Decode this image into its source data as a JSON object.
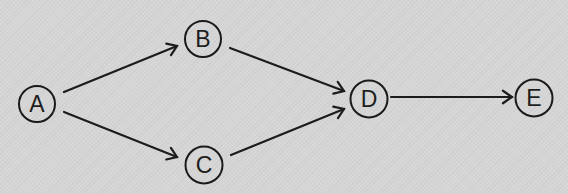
{
  "diagram": {
    "type": "directed-graph",
    "colors": {
      "background": "#d6d6d6",
      "stroke": "#1c1c1c",
      "text": "#1e1e1e"
    },
    "nodes": [
      {
        "id": "A",
        "label": "A",
        "cx": 37,
        "cy": 104,
        "r": 18
      },
      {
        "id": "B",
        "label": "B",
        "cx": 203,
        "cy": 39,
        "r": 18
      },
      {
        "id": "C",
        "label": "C",
        "cx": 204,
        "cy": 165,
        "r": 18.5
      },
      {
        "id": "D",
        "label": "D",
        "cx": 369,
        "cy": 99,
        "r": 18.5
      },
      {
        "id": "E",
        "label": "E",
        "cx": 534,
        "cy": 98,
        "r": 18.5
      }
    ],
    "edges": [
      {
        "from": "A",
        "to": "B",
        "x1": 64,
        "y1": 92,
        "x2": 177,
        "y2": 46
      },
      {
        "from": "A",
        "to": "C",
        "x1": 64,
        "y1": 112,
        "x2": 177,
        "y2": 157
      },
      {
        "from": "B",
        "to": "D",
        "x1": 230,
        "y1": 48,
        "x2": 344,
        "y2": 91
      },
      {
        "from": "C",
        "to": "D",
        "x1": 231,
        "y1": 155,
        "x2": 344,
        "y2": 109
      },
      {
        "from": "D",
        "to": "E",
        "x1": 391,
        "y1": 97,
        "x2": 512,
        "y2": 97
      }
    ]
  }
}
